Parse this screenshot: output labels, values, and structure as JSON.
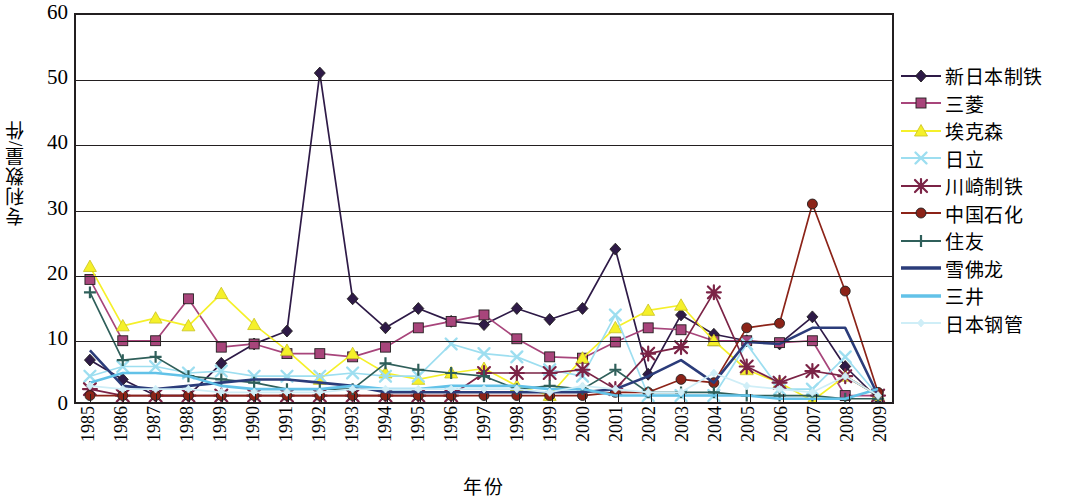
{
  "chart_data": {
    "type": "line",
    "title": "",
    "xlabel": "年份",
    "ylabel": "专利数量/件",
    "ylim": [
      0,
      60
    ],
    "yticks": [
      0,
      10,
      20,
      30,
      40,
      50,
      60
    ],
    "grid": true,
    "legend_position": "right",
    "categories": [
      "1985",
      "1986",
      "1987",
      "1988",
      "1989",
      "1990",
      "1991",
      "1992",
      "1993",
      "1994",
      "1995",
      "1996",
      "1997",
      "1998",
      "1999",
      "2000",
      "2001",
      "2002",
      "2003",
      "2004",
      "2005",
      "2006",
      "2007",
      "2008",
      "2009"
    ],
    "series": [
      {
        "name": "新日本制铁",
        "color": "#2e1a47",
        "marker": "diamond",
        "values": [
          6.5,
          3.5,
          1.0,
          1.0,
          6.0,
          9.0,
          11.0,
          51.0,
          16.0,
          11.5,
          14.5,
          12.5,
          12.0,
          14.5,
          12.8,
          14.5,
          23.7,
          4.3,
          13.5,
          10.5,
          9.5,
          9.0,
          13.2,
          5.5,
          0.5
        ]
      },
      {
        "name": "三菱",
        "color": "#a8457b",
        "marker": "square",
        "values": [
          19.0,
          9.5,
          9.5,
          16.0,
          8.5,
          9.0,
          7.5,
          7.5,
          7.0,
          8.5,
          11.5,
          12.5,
          13.5,
          9.8,
          7.0,
          6.8,
          9.3,
          11.5,
          11.2,
          9.5,
          9.5,
          9.2,
          9.5,
          1.0,
          1.0
        ]
      },
      {
        "name": "埃克森",
        "color": "#f5f02a",
        "marker": "triangle",
        "values": [
          21.0,
          11.8,
          13.0,
          11.8,
          16.8,
          12.0,
          8.0,
          3.5,
          7.5,
          4.5,
          3.5,
          4.5,
          5.2,
          2.5,
          1.0,
          6.8,
          11.5,
          14.2,
          15.0,
          9.5,
          5.0,
          3.0,
          0.2,
          4.0,
          1.0
        ]
      },
      {
        "name": "日立",
        "color": "#9ddef0",
        "marker": "cross",
        "values": [
          4.0,
          5.5,
          5.5,
          4.5,
          4.8,
          4.0,
          4.0,
          4.0,
          4.5,
          4.0,
          4.0,
          9.0,
          7.5,
          7.0,
          5.0,
          4.0,
          13.5,
          1.0,
          1.0,
          1.0,
          9.0,
          2.0,
          2.0,
          7.0,
          1.0
        ]
      },
      {
        "name": "川崎制铁",
        "color": "#7b2346",
        "marker": "star",
        "values": [
          2.0,
          1.0,
          1.0,
          1.0,
          1.0,
          1.0,
          1.0,
          1.0,
          1.0,
          1.0,
          1.0,
          1.0,
          4.5,
          4.5,
          4.5,
          5.0,
          2.0,
          7.5,
          8.5,
          17.0,
          5.5,
          3.0,
          4.8,
          4.0,
          1.0
        ]
      },
      {
        "name": "中国石化",
        "color": "#8c2318",
        "marker": "circle",
        "values": [
          1.0,
          1.0,
          1.0,
          1.0,
          1.0,
          1.0,
          1.0,
          1.0,
          1.0,
          1.0,
          1.0,
          1.0,
          1.0,
          1.0,
          1.0,
          1.0,
          1.5,
          1.5,
          3.5,
          3.0,
          11.5,
          12.2,
          30.7,
          17.2,
          1.5
        ]
      },
      {
        "name": "住友",
        "color": "#2f5f5a",
        "marker": "plus",
        "values": [
          17.0,
          6.5,
          7.0,
          4.0,
          3.5,
          3.0,
          2.0,
          2.0,
          2.0,
          6.0,
          5.0,
          4.5,
          4.0,
          2.0,
          2.5,
          2.0,
          5.0,
          1.5,
          1.5,
          1.5,
          1.0,
          1.0,
          1.0,
          0.5,
          0.5
        ]
      },
      {
        "name": "雪佛龙",
        "color": "#2b3c7a",
        "marker": "none",
        "values": [
          8.0,
          2.5,
          2.0,
          2.5,
          3.0,
          3.5,
          3.5,
          3.0,
          2.5,
          1.5,
          1.5,
          1.5,
          1.5,
          1.5,
          1.5,
          1.5,
          2.0,
          4.0,
          6.5,
          3.0,
          9.3,
          9.0,
          11.5,
          11.5,
          1.0
        ]
      },
      {
        "name": "三井",
        "color": "#62c2e8",
        "marker": "none",
        "values": [
          3.0,
          4.5,
          4.5,
          4.0,
          2.5,
          2.0,
          2.0,
          2.0,
          2.5,
          2.0,
          2.0,
          2.5,
          2.5,
          2.5,
          2.0,
          2.0,
          1.0,
          1.0,
          1.0,
          1.0,
          1.0,
          0.5,
          0.5,
          0.5,
          2.0
        ]
      },
      {
        "name": "日本钢管",
        "color": "#cfeef7",
        "marker": "diamond-sm",
        "values": [
          2.5,
          2.0,
          2.0,
          2.0,
          1.5,
          1.5,
          1.5,
          1.5,
          2.0,
          2.0,
          2.0,
          2.0,
          2.0,
          2.0,
          1.5,
          2.5,
          2.0,
          1.5,
          1.5,
          4.5,
          2.5,
          2.0,
          1.5,
          4.0,
          1.0
        ]
      }
    ]
  },
  "axes": {
    "y_title": "专利数量/件",
    "x_title": "年份"
  }
}
